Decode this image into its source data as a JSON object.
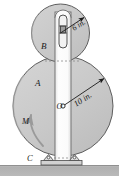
{
  "figure": {
    "kind": "engineering-mechanics-diagram",
    "colors": {
      "disk_fill": "#c9c9c9",
      "disk_stroke": "#5a5a5a",
      "bar_fill": "#fcfcfc",
      "bar_stroke": "#6a6a6a",
      "ground_fill": "#b3b3b3",
      "ground_stroke": "#8a8a8a",
      "hatch_fill": "#d8d8d8",
      "annotation": "#1a1a1a",
      "moment_arrow": "#9a9a9a"
    },
    "disks": [
      {
        "id": "disk-b",
        "label": "B",
        "label_x": 44,
        "label_y": 47,
        "cx": 60.5,
        "cy": 33,
        "r": 29,
        "dimension": {
          "text": "6 in.",
          "text_x": 78,
          "text_y": 28,
          "rotation": -32,
          "from_x": 60.5,
          "from_y": 33,
          "to_x": 85,
          "to_y": 17
        }
      },
      {
        "id": "disk-a",
        "label": "A",
        "label_x": 38,
        "label_y": 84,
        "cx": 63,
        "cy": 106,
        "r": 50,
        "dimension": {
          "text": "10 in.",
          "text_x": 88,
          "text_y": 101,
          "rotation": -33,
          "from_x": 63,
          "from_y": 106,
          "to_x": 105,
          "to_y": 78
        }
      }
    ],
    "center_point": {
      "label": "O",
      "x": 63,
      "y": 106,
      "label_x": 58,
      "label_y": 108
    },
    "moment": {
      "label": "M",
      "label_x": 26,
      "label_y": 121,
      "arrow_tip_x": 31,
      "arrow_tip_y": 114
    },
    "support": {
      "label": "C",
      "label_x": 30,
      "label_y": 160,
      "plate_x": 44,
      "plate_y": 160,
      "plate_w": 38,
      "plate_h": 5
    },
    "bar": {
      "x": 55,
      "y": 12,
      "w": 16,
      "h": 150,
      "slot": {
        "x": 59,
        "y": 15,
        "w": 8,
        "h": 33,
        "block_x": 60.5,
        "block_y": 26,
        "block_w": 5,
        "block_h": 7
      }
    },
    "ground": {
      "x": 0,
      "y": 165,
      "w": 119,
      "h": 11
    }
  }
}
